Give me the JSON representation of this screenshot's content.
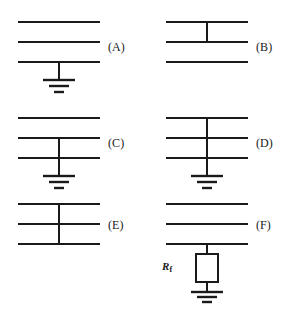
{
  "figure": {
    "background_color": "#ffffff",
    "line_color": "#1a1a1a",
    "panel_count": 6
  },
  "panels": [
    {
      "id": "A",
      "label": "(A)",
      "description": "Three horizontal conductors; bottom conductor connected to ground",
      "conductors": 3,
      "tap_from_conductor": 3,
      "tap_to_conductor": 3,
      "has_ground": true,
      "has_resistor": false,
      "resistor_label": null
    },
    {
      "id": "B",
      "label": "(B)",
      "description": "Three horizontal conductors; vertical link between top and middle conductor, no ground",
      "conductors": 3,
      "tap_from_conductor": 1,
      "tap_to_conductor": 2,
      "has_ground": false,
      "has_resistor": false,
      "resistor_label": null
    },
    {
      "id": "C",
      "label": "(C)",
      "description": "Three horizontal conductors; vertical link from middle conductor through bottom conductor to ground",
      "conductors": 3,
      "tap_from_conductor": 2,
      "tap_to_conductor": 3,
      "has_ground": true,
      "has_resistor": false,
      "resistor_label": null
    },
    {
      "id": "D",
      "label": "(D)",
      "description": "Three horizontal conductors; vertical link joining all three conductors down to ground",
      "conductors": 3,
      "tap_from_conductor": 1,
      "tap_to_conductor": 3,
      "has_ground": true,
      "has_resistor": false,
      "resistor_label": null
    },
    {
      "id": "E",
      "label": "(E)",
      "description": "Three horizontal conductors; vertical link joining all three conductors, no ground",
      "conductors": 3,
      "tap_from_conductor": 1,
      "tap_to_conductor": 3,
      "has_ground": false,
      "has_resistor": false,
      "resistor_label": null
    },
    {
      "id": "F",
      "label": "(F)",
      "description": "Three horizontal conductors; bottom conductor connected to ground through a resistor",
      "conductors": 3,
      "tap_from_conductor": 3,
      "tap_to_conductor": 3,
      "has_ground": true,
      "has_resistor": true,
      "resistor_label": {
        "symbol": "R",
        "subscript": "f"
      }
    }
  ]
}
